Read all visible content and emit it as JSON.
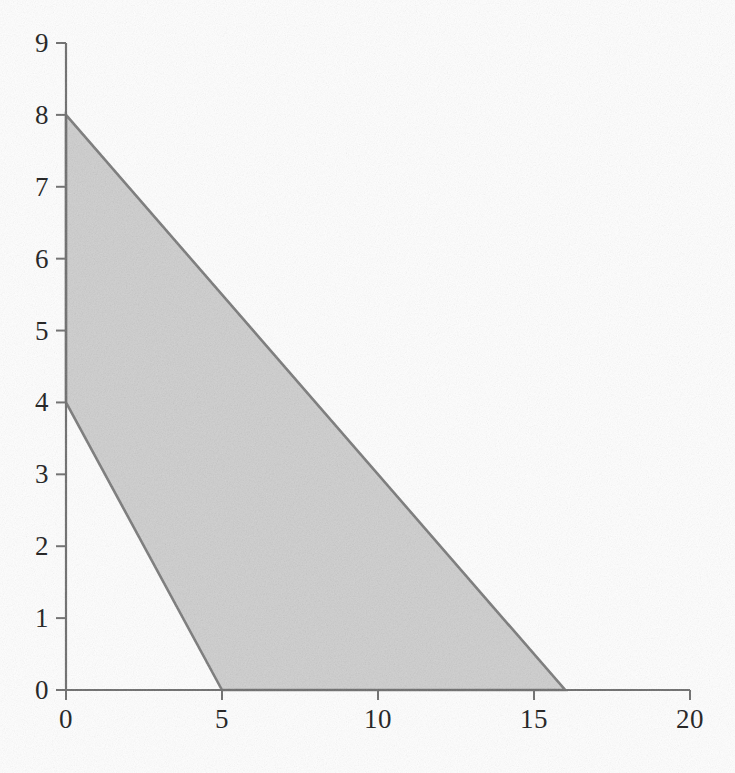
{
  "figure": {
    "title": "",
    "background_color": "#fefefe"
  },
  "chart_data": {
    "type": "area",
    "title": "",
    "subtitle": "",
    "xlabel": "",
    "ylabel": "",
    "xlim": [
      0,
      20
    ],
    "ylim": [
      0,
      9
    ],
    "xticks": [
      0,
      5,
      10,
      15,
      20
    ],
    "yticks": [
      0,
      1,
      2,
      3,
      4,
      5,
      6,
      7,
      8,
      9
    ],
    "xtick_labels": [
      "0",
      "5",
      "10",
      "15",
      "20"
    ],
    "ytick_labels": [
      "0",
      "1",
      "2",
      "3",
      "4",
      "5",
      "6",
      "7",
      "8",
      "9"
    ],
    "grid": false,
    "legend": null,
    "annotations": [],
    "shaded_region": {
      "name": "feasible-region",
      "fill_color": "#d2d2d2",
      "edge_color": "#7a7a7a",
      "edge_width": 2,
      "vertices": [
        {
          "x": 0,
          "y": 8
        },
        {
          "x": 16,
          "y": 0
        },
        {
          "x": 5,
          "y": 0
        },
        {
          "x": 0,
          "y": 4
        }
      ]
    },
    "series": [
      {
        "name": "upper-boundary-line",
        "type": "line",
        "color": "#7a7a7a",
        "x": [
          0,
          16
        ],
        "values": [
          8,
          0
        ],
        "intercepts": {
          "x": 16,
          "y": 8
        },
        "slope": -0.5
      },
      {
        "name": "lower-boundary-line",
        "type": "line",
        "color": "#7a7a7a",
        "x": [
          0,
          5
        ],
        "values": [
          4,
          0
        ],
        "intercepts": {
          "x": 5,
          "y": 4
        },
        "slope": -0.8
      }
    ]
  },
  "axes": {
    "axis_color": "#6d6d6d",
    "tick_color": "#6d6d6d",
    "label_color": "#1c1c1c",
    "x_axis_name": "x-axis",
    "y_axis_name": "y-axis"
  }
}
